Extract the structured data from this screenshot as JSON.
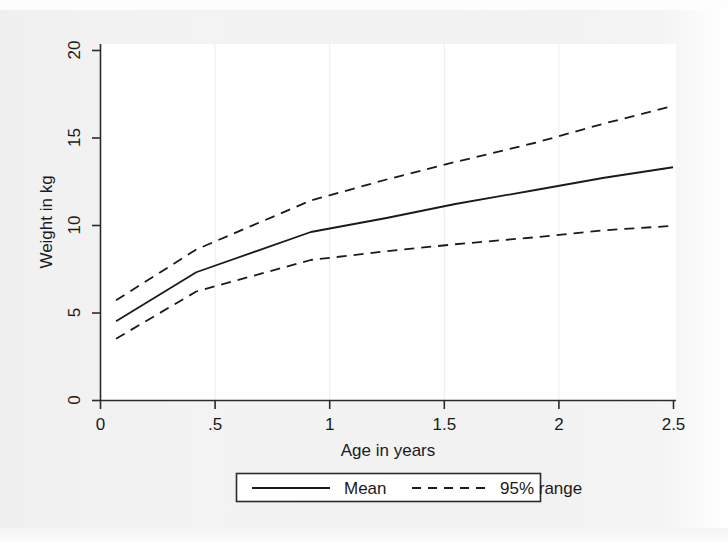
{
  "chart_data": {
    "type": "line",
    "title": "",
    "xlabel": "Age in years",
    "ylabel": "Weight in kg",
    "xlim": [
      0,
      2.62
    ],
    "ylim": [
      0,
      21.5
    ],
    "xticks": [
      0,
      0.5,
      1,
      1.5,
      2,
      2.5
    ],
    "xticklabels": [
      "0",
      ".5",
      "1",
      "1.5",
      "2",
      "2.5"
    ],
    "yticks": [
      0,
      5,
      10,
      15,
      20
    ],
    "yticklabels": [
      "0",
      "5",
      "10",
      "15",
      "20"
    ],
    "grid": "light vertical gridlines at x = .5, 1, 1.5, 2",
    "legend_position": "below axes, centered, boxed",
    "x": [
      0.07,
      0.42,
      0.92,
      1.25,
      1.55,
      1.9,
      2.2,
      2.5
    ],
    "series": [
      {
        "name": "95% range",
        "role": "upper",
        "style": "dashed",
        "color": "#1a1a1a",
        "values": [
          5.7,
          8.6,
          11.4,
          12.6,
          13.6,
          14.7,
          15.8,
          16.8
        ]
      },
      {
        "name": "Mean",
        "role": "mean",
        "style": "solid",
        "color": "#1a1a1a",
        "values": [
          4.5,
          7.3,
          9.6,
          10.4,
          11.2,
          12.0,
          12.7,
          13.3
        ]
      },
      {
        "name": "95% range",
        "role": "lower",
        "style": "dashed",
        "color": "#1a1a1a",
        "values": [
          3.5,
          6.2,
          8.0,
          8.5,
          8.9,
          9.3,
          9.7,
          9.95
        ]
      }
    ]
  },
  "axes": {
    "y_axis_title": "Weight in kg",
    "x_axis_title": "Age in years",
    "x_tick_labels": [
      "0",
      ".5",
      "1",
      "1.5",
      "2",
      "2.5"
    ],
    "y_tick_labels": [
      "0",
      "5",
      "10",
      "15",
      "20"
    ]
  },
  "legend": {
    "items": [
      {
        "label": "Mean",
        "style": "solid"
      },
      {
        "label": "95% range",
        "style": "dashed"
      }
    ]
  }
}
